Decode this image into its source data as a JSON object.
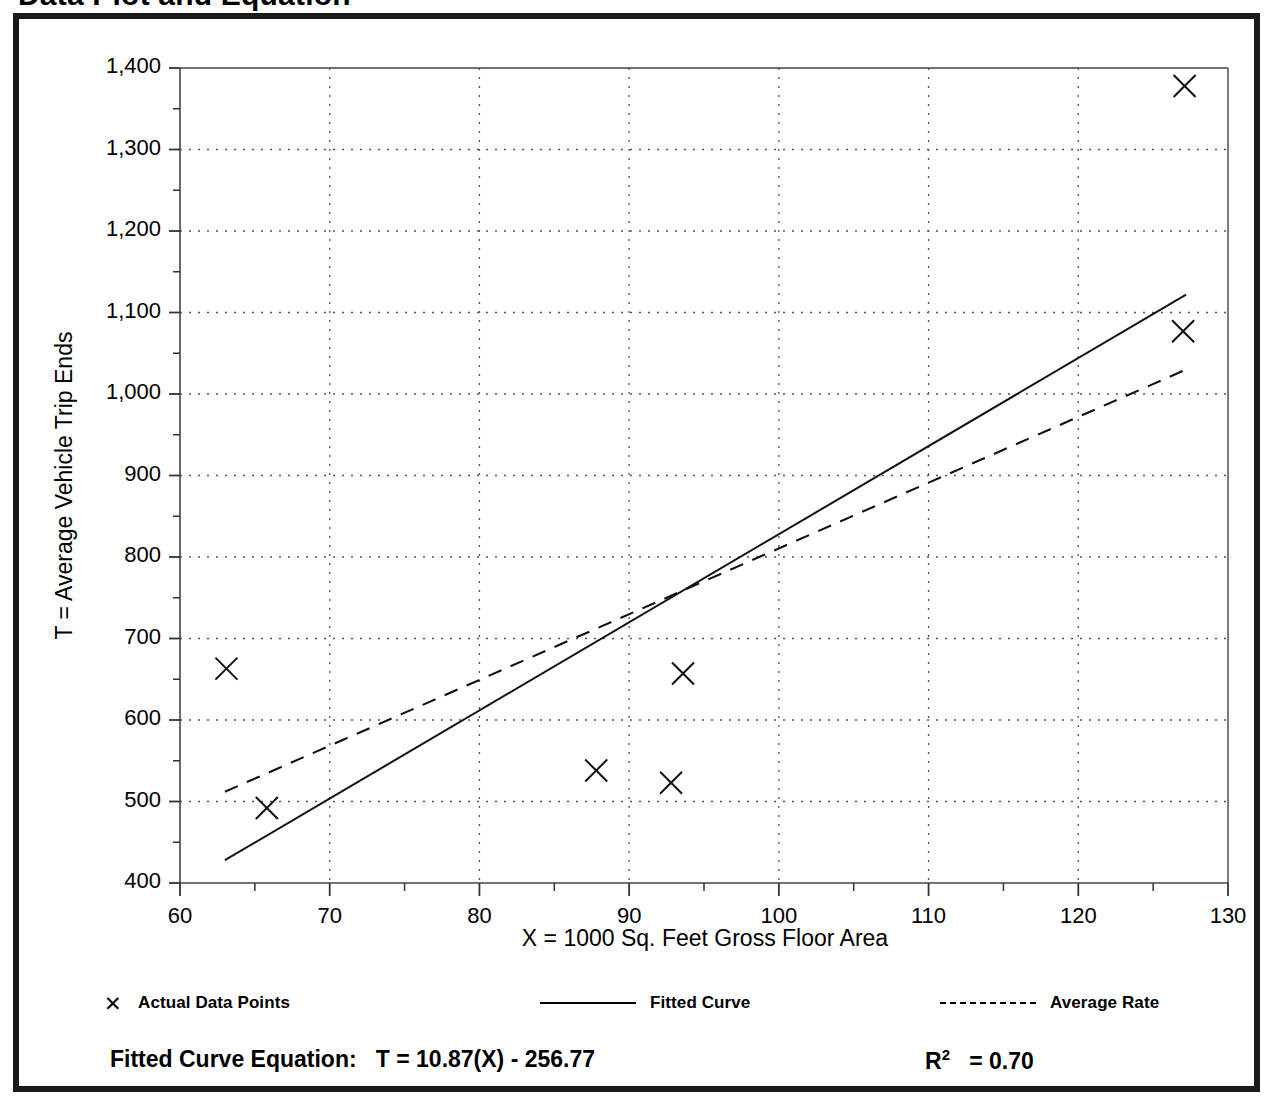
{
  "page": {
    "title": "Data Plot and Equation"
  },
  "axes": {
    "y_title": "T = Average Vehicle Trip Ends",
    "x_title": "X = 1000 Sq. Feet Gross Floor Area"
  },
  "legend": {
    "actual": {
      "label": "Actual Data Points",
      "marker": "x-marker-icon"
    },
    "fitted": {
      "label": "Fitted Curve",
      "marker": "solid-line-icon"
    },
    "average": {
      "label": "Average Rate",
      "marker": "dashed-line-icon"
    }
  },
  "footer": {
    "equation_label": "Fitted Curve Equation:",
    "equation_value": "T = 10.87(X) - 256.77",
    "r_squared_symbol": "R",
    "r_squared_exponent": "2",
    "r_squared_value": "= 0.70"
  },
  "chart_data": {
    "type": "scatter",
    "title": "Data Plot and Equation",
    "xlabel": "X = 1000 Sq. Feet Gross Floor Area",
    "ylabel": "T = Average Vehicle Trip Ends",
    "xlim": [
      60,
      130
    ],
    "ylim": [
      400,
      1400
    ],
    "x_major_ticks": [
      60,
      70,
      80,
      90,
      100,
      110,
      120,
      130
    ],
    "x_minor_ticks": [
      65,
      75,
      85,
      95,
      105,
      115,
      125
    ],
    "y_major_ticks": [
      400,
      500,
      600,
      700,
      800,
      900,
      1000,
      1100,
      1200,
      1300,
      1400
    ],
    "y_minor_ticks": [
      450,
      550,
      650,
      750,
      850,
      950,
      1050,
      1150,
      1250,
      1350
    ],
    "x_tick_labels": [
      "60",
      "70",
      "80",
      "90",
      "100",
      "110",
      "120",
      "130"
    ],
    "y_tick_labels": [
      "400",
      "500",
      "600",
      "700",
      "800",
      "900",
      "1,000",
      "1,100",
      "1,200",
      "1,300",
      "1,400"
    ],
    "grid": true,
    "grid_style": "dotted",
    "legend_position": "below-plot",
    "series": [
      {
        "name": "Actual Data Points",
        "type": "scatter",
        "marker": "x",
        "points": [
          {
            "x": 63.1,
            "y": 663
          },
          {
            "x": 65.8,
            "y": 492
          },
          {
            "x": 87.8,
            "y": 538
          },
          {
            "x": 92.8,
            "y": 523
          },
          {
            "x": 93.6,
            "y": 657
          },
          {
            "x": 127.0,
            "y": 1077
          },
          {
            "x": 127.1,
            "y": 1378
          }
        ]
      },
      {
        "name": "Fitted Curve",
        "type": "line",
        "style": "solid",
        "equation": "T = 10.87(X) - 256.77",
        "slope": 10.87,
        "intercept": -256.77,
        "r_squared": 0.7,
        "endpoints": [
          {
            "x": 63.0,
            "y": 428
          },
          {
            "x": 127.2,
            "y": 1122
          }
        ]
      },
      {
        "name": "Average Rate",
        "type": "line",
        "style": "dashed",
        "endpoints": [
          {
            "x": 63.0,
            "y": 512
          },
          {
            "x": 127.2,
            "y": 1030
          }
        ]
      }
    ]
  }
}
